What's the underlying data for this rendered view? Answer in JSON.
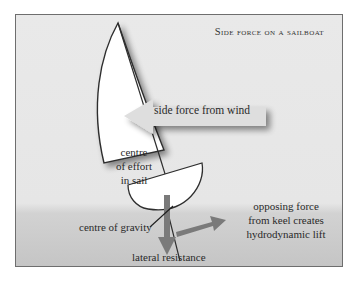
{
  "title": "Side force on a sailboat",
  "labels": {
    "side_force": "side force from wind",
    "centre_effort_1": "centre",
    "centre_effort_2": "of effort",
    "centre_effort_3": "in sail",
    "centre_gravity": "centre of gravity",
    "opposing_1": "opposing force",
    "opposing_2": "from keel creates",
    "opposing_3": "hydrodynamic lift",
    "lateral": "lateral resistance"
  },
  "colors": {
    "background": "#e8e8e8",
    "water": "#c6c6c6",
    "sail": "#ffffff",
    "outline": "#2e2e2e",
    "arrow_side_force": "#dcdcdc",
    "arrow_force": "#7a7a7a"
  }
}
